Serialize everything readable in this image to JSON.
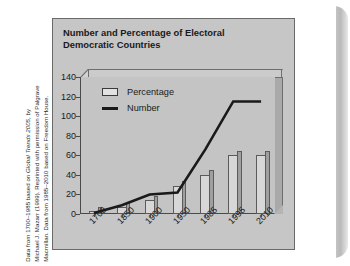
{
  "figure": {
    "title": "Number and Percentage of Electoral Democratic Countries",
    "caption_lines": [
      "Data from 1700–1985 based on Global Trends 2005, by",
      "Michael J. Mazarr (1999). Reprinted with permission of Palgrave",
      "Macmillan. Data from 1985–2010 based on Freedom House."
    ],
    "colors": {
      "frame_background": "#c6c6c6",
      "plot_background": "#c4c4c4",
      "bar_fill": "#d7d7d7",
      "bar_outline": "#5b5b5b",
      "line_color": "#1a1a1a",
      "text": "#1a1a1a"
    }
  },
  "chart_data": {
    "type": "bar",
    "title": "Number and Percentage of Electoral Democratic Countries",
    "categories": [
      "1700",
      "1850",
      "1900",
      "1950",
      "1985",
      "1995",
      "2010"
    ],
    "series": [
      {
        "name": "Percentage",
        "type": "bar",
        "values": [
          3,
          7,
          14,
          29,
          40,
          60,
          60
        ]
      },
      {
        "name": "Number",
        "type": "line",
        "values": [
          1,
          9,
          20,
          22,
          66,
          115,
          115
        ]
      }
    ],
    "xlabel": "",
    "ylabel": "",
    "ylim": [
      0,
      140
    ],
    "yticks": [
      0,
      20,
      40,
      60,
      80,
      100,
      120,
      140
    ],
    "ytick_labels": [
      "0",
      "20",
      "40",
      "60",
      "80",
      "100",
      "120",
      "140"
    ],
    "grid": false,
    "legend_position": "upper-left",
    "legend_entries": [
      "Percentage",
      "Number"
    ]
  }
}
